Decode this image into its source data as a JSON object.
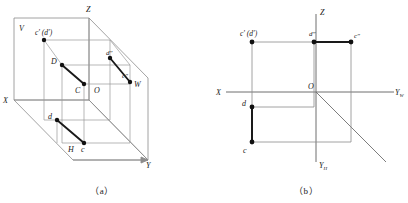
{
  "figure": {
    "caption_a": "（a）",
    "caption_b": "（b）",
    "stroke_thin": "#8c8c8c",
    "stroke_medium": "#5a5a5a",
    "stroke_heavy": "#1a1a1a",
    "point_color": "#111111",
    "background": "#ffffff"
  },
  "panel_a": {
    "name": "pictorial-three-plane-system",
    "axes": [
      {
        "id": "z",
        "label": "Z"
      },
      {
        "id": "x",
        "label": "X"
      },
      {
        "id": "y",
        "label": "Y"
      }
    ],
    "planes": [
      {
        "id": "v",
        "label": "V"
      },
      {
        "id": "h",
        "label": "H"
      },
      {
        "id": "w",
        "label": "W"
      }
    ],
    "origin_label": "O",
    "points": [
      {
        "id": "cd_front",
        "label": "c′ (d′)",
        "x": 44,
        "y": 40
      },
      {
        "id": "d_space",
        "label": "D",
        "x": 62,
        "y": 65
      },
      {
        "id": "c_space",
        "label": "C",
        "x": 84,
        "y": 84
      },
      {
        "id": "d_side",
        "label": "d″",
        "x": 110,
        "y": 58
      },
      {
        "id": "c_side",
        "label": "c″",
        "x": 130,
        "y": 82
      },
      {
        "id": "d_top",
        "label": "d",
        "x": 57,
        "y": 120
      },
      {
        "id": "c_top",
        "label": "c",
        "x": 84,
        "y": 143
      }
    ],
    "segments": [
      {
        "id": "CD-space",
        "from": "D",
        "to": "C",
        "weight": "heavy"
      },
      {
        "id": "cd-side",
        "from": "d″",
        "to": "c″",
        "weight": "heavy"
      },
      {
        "id": "cd-top",
        "from": "d",
        "to": "c",
        "weight": "heavy"
      }
    ]
  },
  "panel_b": {
    "name": "unfolded-orthographic-projection",
    "axes": [
      {
        "id": "z",
        "label": "Z"
      },
      {
        "id": "x",
        "label": "X"
      },
      {
        "id": "yw",
        "label": "Y",
        "subscript": "W"
      },
      {
        "id": "yh",
        "label": "Y",
        "subscript": "H"
      }
    ],
    "origin_label": "O",
    "points": [
      {
        "id": "cd_front",
        "label": "c′ (d′)",
        "x": 48,
        "y": 42
      },
      {
        "id": "d_side",
        "label": "d″",
        "x": 110,
        "y": 42
      },
      {
        "id": "c_side",
        "label": "c″",
        "x": 147,
        "y": 42
      },
      {
        "id": "d_top",
        "label": "d",
        "x": 48,
        "y": 107
      },
      {
        "id": "c_top",
        "label": "c",
        "x": 48,
        "y": 142
      }
    ],
    "segments": [
      {
        "id": "front-proj-point",
        "note": "c′ coincides with d′"
      },
      {
        "id": "side-proj",
        "from": "d″",
        "to": "c″",
        "weight": "heavy"
      },
      {
        "id": "top-proj",
        "from": "d",
        "to": "c",
        "weight": "heavy"
      }
    ],
    "miter_line": {
      "id": "45-degree-line",
      "from_origin": true
    }
  }
}
